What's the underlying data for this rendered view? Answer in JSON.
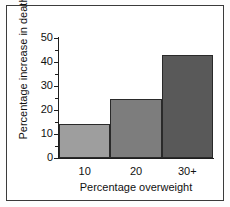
{
  "figure": {
    "background_color": "#ffffff",
    "frame_color": "#3b3b3b"
  },
  "chart_data": {
    "type": "bar",
    "title": "",
    "subtitle": "",
    "xlabel": "Percentage overweight",
    "ylabel": "Percentage increase in death",
    "categories": [
      "10",
      "20",
      "30+"
    ],
    "values": [
      14,
      24.5,
      43
    ],
    "ylim": [
      0,
      50
    ],
    "y_major_ticks": [
      0,
      10,
      20,
      30,
      40,
      50
    ],
    "y_minor_ticks": [
      5,
      15,
      25,
      35,
      45
    ],
    "y_tick_labels": [
      "0",
      "10",
      "20",
      "30",
      "40",
      "50"
    ],
    "x_tick_labels": [
      "10",
      "20",
      "30+"
    ],
    "grid": false,
    "legend": false,
    "legend_position": "none",
    "bar_colors": [
      "#9e9e9e",
      "#7d7d7d",
      "#595959"
    ],
    "bar_edge_color": "#2a2a2a",
    "bars_adjacent": true
  }
}
